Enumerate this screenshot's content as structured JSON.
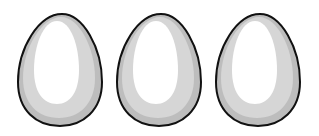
{
  "scene": {
    "description": "Three illustrated eggs side by side",
    "background": "#ffffff",
    "eggs": [
      {
        "index": 1,
        "left": 15,
        "base_color": "#d9d9d9",
        "shadow_color": "#bdbdbd",
        "highlight_color": "#ffffff",
        "outline_color": "#111111"
      },
      {
        "index": 2,
        "left": 114,
        "base_color": "#d9d9d9",
        "shadow_color": "#bdbdbd",
        "highlight_color": "#ffffff",
        "outline_color": "#111111"
      },
      {
        "index": 3,
        "left": 213,
        "base_color": "#d9d9d9",
        "shadow_color": "#bdbdbd",
        "highlight_color": "#ffffff",
        "outline_color": "#111111"
      }
    ]
  }
}
